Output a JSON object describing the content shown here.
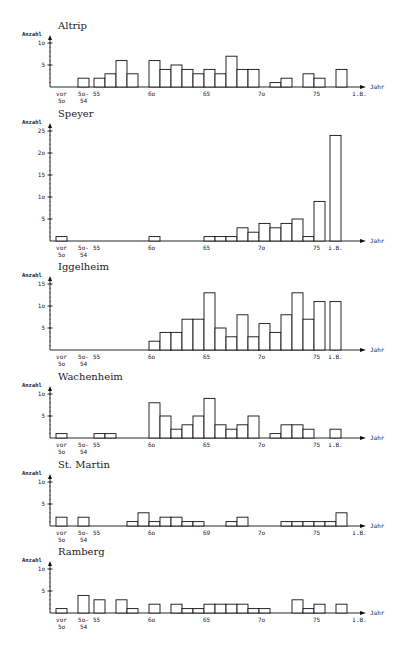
{
  "chart_data": [
    {
      "type": "bar",
      "title": "Altrip",
      "ylabel": "Anzahl",
      "xlabel": "Jahr",
      "ylim": [
        0,
        10
      ],
      "yticks": [
        "5",
        "1o"
      ],
      "ytick_values": [
        5,
        10
      ],
      "xtick_labels": [
        {
          "slot": "vor50",
          "label": "vor\n5o"
        },
        {
          "slot": "50-54",
          "label": "5o-\n54"
        },
        {
          "slot": "55",
          "label": "55"
        },
        {
          "slot": "60",
          "label": "6o"
        },
        {
          "slot": "65",
          "label": "65"
        },
        {
          "slot": "70",
          "label": "7o"
        },
        {
          "slot": "75",
          "label": "75"
        },
        {
          "slot": "iB_far",
          "label": "i.B."
        }
      ],
      "categories": [
        "50-54",
        "55",
        "56",
        "57",
        "58",
        "60",
        "61",
        "62",
        "63",
        "64",
        "65",
        "66",
        "67",
        "68",
        "69",
        "71",
        "72",
        "74",
        "75",
        "77"
      ],
      "values": [
        2,
        2,
        3,
        6,
        3,
        6,
        4,
        5,
        4,
        3,
        4,
        3,
        7,
        4,
        4,
        1,
        2,
        3,
        2,
        4
      ]
    },
    {
      "type": "bar",
      "title": "Speyer",
      "ylabel": "Anzahl",
      "xlabel": "Jahr",
      "ylim": [
        0,
        25
      ],
      "yticks": [
        "5",
        "1o",
        "15",
        "2o",
        "25"
      ],
      "ytick_values": [
        5,
        10,
        15,
        20,
        25
      ],
      "xtick_labels": [
        {
          "slot": "vor50",
          "label": "vor\n5o"
        },
        {
          "slot": "50-54",
          "label": "5o-\n54"
        },
        {
          "slot": "55",
          "label": "55"
        },
        {
          "slot": "60",
          "label": "6o"
        },
        {
          "slot": "65",
          "label": "65"
        },
        {
          "slot": "70",
          "label": "7o"
        },
        {
          "slot": "75",
          "label": "75"
        },
        {
          "slot": "iB",
          "label": "i.B."
        }
      ],
      "categories": [
        "vor50",
        "60",
        "65",
        "66",
        "67",
        "68",
        "69",
        "70",
        "71",
        "72",
        "73",
        "74",
        "75",
        "iB"
      ],
      "values": [
        1,
        1,
        1,
        1,
        1,
        3,
        2,
        4,
        3,
        4,
        5,
        1,
        9,
        24
      ]
    },
    {
      "type": "bar",
      "title": "Iggelheim",
      "ylabel": "Anzahl",
      "xlabel": "Jahr",
      "ylim": [
        0,
        15
      ],
      "yticks": [
        "5",
        "1o",
        "15"
      ],
      "ytick_values": [
        5,
        10,
        15
      ],
      "xtick_labels": [
        {
          "slot": "vor50",
          "label": "vor\n5o"
        },
        {
          "slot": "50-54",
          "label": "5o-\n54"
        },
        {
          "slot": "55",
          "label": "55"
        },
        {
          "slot": "60",
          "label": "6o"
        },
        {
          "slot": "65",
          "label": "65"
        },
        {
          "slot": "70",
          "label": "7o"
        },
        {
          "slot": "75",
          "label": "75"
        },
        {
          "slot": "iB",
          "label": "i.B."
        }
      ],
      "categories": [
        "60",
        "61",
        "62",
        "63",
        "64",
        "65",
        "66",
        "67",
        "68",
        "69",
        "70",
        "71",
        "72",
        "73",
        "74",
        "75",
        "iB"
      ],
      "values": [
        2,
        4,
        4,
        7,
        7,
        13,
        5,
        3,
        8,
        3,
        6,
        4,
        8,
        13,
        7,
        11,
        11
      ]
    },
    {
      "type": "bar",
      "title": "Wachenheim",
      "ylabel": "Anzahl",
      "xlabel": "Jahr",
      "ylim": [
        0,
        10
      ],
      "yticks": [
        "5",
        "1o"
      ],
      "ytick_values": [
        5,
        10
      ],
      "xtick_labels": [
        {
          "slot": "vor50",
          "label": "vor\n5o"
        },
        {
          "slot": "50-54",
          "label": "5o-\n54"
        },
        {
          "slot": "55",
          "label": "55"
        },
        {
          "slot": "60",
          "label": "6o"
        },
        {
          "slot": "65",
          "label": "65"
        },
        {
          "slot": "70",
          "label": "7o"
        },
        {
          "slot": "75",
          "label": "75"
        },
        {
          "slot": "iB",
          "label": "i.B."
        }
      ],
      "categories": [
        "vor50",
        "55",
        "56",
        "60",
        "61",
        "62",
        "63",
        "64",
        "65",
        "66",
        "67",
        "68",
        "69",
        "71",
        "72",
        "73",
        "74",
        "iB"
      ],
      "values": [
        1,
        1,
        1,
        8,
        5,
        2,
        3,
        5,
        9,
        3,
        2,
        3,
        5,
        1,
        3,
        3,
        2,
        2
      ]
    },
    {
      "type": "bar",
      "title": "St. Martin",
      "ylabel": "Anzahl",
      "xlabel": "Jahr",
      "ylim": [
        0,
        10
      ],
      "yticks": [
        "5",
        "1o"
      ],
      "ytick_values": [
        5,
        10
      ],
      "xtick_labels": [
        {
          "slot": "vor50",
          "label": "vor\n5o"
        },
        {
          "slot": "50-54",
          "label": "5o-\n54"
        },
        {
          "slot": "55",
          "label": "55"
        },
        {
          "slot": "60",
          "label": "6o"
        },
        {
          "slot": "65",
          "label": "69"
        },
        {
          "slot": "70",
          "label": "7o"
        },
        {
          "slot": "75",
          "label": "75"
        },
        {
          "slot": "iB_far",
          "label": "i.B."
        }
      ],
      "categories": [
        "vor50",
        "50-54",
        "58",
        "59",
        "60",
        "61",
        "62",
        "63",
        "64",
        "67",
        "68",
        "72",
        "73",
        "74",
        "75",
        "76",
        "77"
      ],
      "values": [
        2,
        2,
        1,
        3,
        1,
        2,
        2,
        1,
        1,
        1,
        2,
        1,
        1,
        1,
        1,
        1,
        3
      ]
    },
    {
      "type": "bar",
      "title": "Ramberg",
      "ylabel": "Anzahl",
      "xlabel": "Jahr",
      "ylim": [
        0,
        10
      ],
      "yticks": [
        "5",
        "1o"
      ],
      "ytick_values": [
        5,
        10
      ],
      "xtick_labels": [
        {
          "slot": "vor50",
          "label": "vor\n5o"
        },
        {
          "slot": "50-54",
          "label": "5o-\n54"
        },
        {
          "slot": "55",
          "label": "55"
        },
        {
          "slot": "60",
          "label": "6o"
        },
        {
          "slot": "65",
          "label": "65"
        },
        {
          "slot": "70",
          "label": "7o"
        },
        {
          "slot": "75",
          "label": "75"
        },
        {
          "slot": "iB_far",
          "label": "i.B."
        }
      ],
      "categories": [
        "vor50",
        "50-54",
        "55",
        "57",
        "58",
        "60",
        "62",
        "63",
        "64",
        "65",
        "66",
        "67",
        "68",
        "69",
        "70",
        "73",
        "74",
        "75",
        "77"
      ],
      "values": [
        1,
        4,
        3,
        3,
        1,
        2,
        2,
        1,
        1,
        2,
        2,
        2,
        2,
        1,
        1,
        3,
        1,
        2,
        2
      ]
    }
  ]
}
